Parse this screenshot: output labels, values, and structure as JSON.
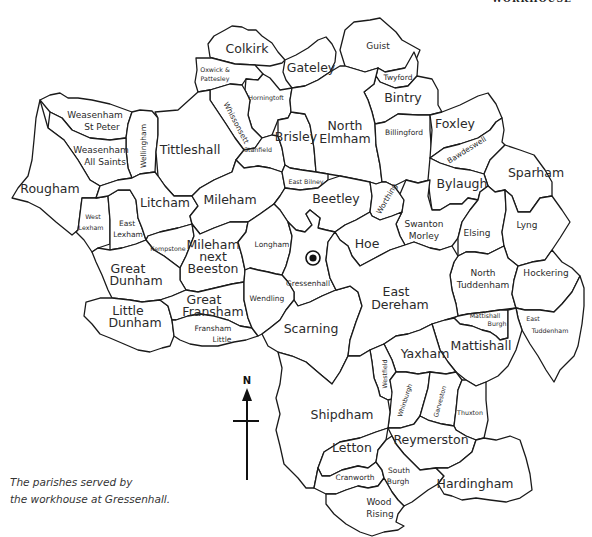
{
  "header": {
    "cropped_title_fragment": "WORKHOUSE"
  },
  "caption": {
    "line1": "The parishes served by",
    "line2": "the workhouse at Gressenhall."
  },
  "compass": {
    "label": "N"
  },
  "workhouse_marker": {
    "name": "Gressenhall workhouse",
    "icon": "target-circle-icon"
  },
  "parishes": [
    {
      "id": "colkirk",
      "label": "Colkirk"
    },
    {
      "id": "oxwick",
      "label": "Oxwick &",
      "label2": "Pattesley"
    },
    {
      "id": "gateley",
      "label": "Gateley"
    },
    {
      "id": "guist",
      "label": "Guist"
    },
    {
      "id": "twyford",
      "label": "Twyford"
    },
    {
      "id": "bintry",
      "label": "Bintry"
    },
    {
      "id": "horningtoft",
      "label": "Horningtoft"
    },
    {
      "id": "whissonsett",
      "label": "Whissonsett"
    },
    {
      "id": "weasenham-st-peter",
      "label": "Weasenham",
      "label2": "St Peter"
    },
    {
      "id": "weasenham-all-saints",
      "label": "Weasenham",
      "label2": "All Saints"
    },
    {
      "id": "wellingham",
      "label": "Wellingham"
    },
    {
      "id": "tittleshall",
      "label": "Tittleshall"
    },
    {
      "id": "stanfield",
      "label": "Stanfield"
    },
    {
      "id": "brisley",
      "label": "Brisley"
    },
    {
      "id": "north-elmham",
      "label": "North",
      "label2": "Elmham"
    },
    {
      "id": "billingford",
      "label": "Billingford"
    },
    {
      "id": "foxley",
      "label": "Foxley"
    },
    {
      "id": "bawdeswell",
      "label": "Bawdeswell"
    },
    {
      "id": "sparham",
      "label": "Sparham"
    },
    {
      "id": "bylaugh",
      "label": "Bylaugh"
    },
    {
      "id": "rougham",
      "label": "Rougham"
    },
    {
      "id": "west-lexham",
      "label": "West",
      "label2": "Lexham"
    },
    {
      "id": "east-lexham",
      "label": "East",
      "label2": "Lexham"
    },
    {
      "id": "litcham",
      "label": "Litcham"
    },
    {
      "id": "mileham",
      "label": "Mileham"
    },
    {
      "id": "east-bilney",
      "label": "East Bilney"
    },
    {
      "id": "beetley",
      "label": "Beetley"
    },
    {
      "id": "worthing",
      "label": "Worthing"
    },
    {
      "id": "swanton-morley",
      "label": "Swanton",
      "label2": "Morley"
    },
    {
      "id": "elsing",
      "label": "Elsing"
    },
    {
      "id": "lyng",
      "label": "Lyng"
    },
    {
      "id": "kempstone",
      "label": "Kempstone"
    },
    {
      "id": "mileham-next-beeston",
      "label": "Mileham",
      "label2": "next",
      "label3": "Beeston"
    },
    {
      "id": "longham",
      "label": "Longham"
    },
    {
      "id": "gressenhall",
      "label": "Gressenhall"
    },
    {
      "id": "hoe",
      "label": "Hoe"
    },
    {
      "id": "great-dunham",
      "label": "Great",
      "label2": "Dunham"
    },
    {
      "id": "north-tuddenham",
      "label": "North",
      "label2": "Tuddenham"
    },
    {
      "id": "hockering",
      "label": "Hockering"
    },
    {
      "id": "little-dunham",
      "label": "Little",
      "label2": "Dunham"
    },
    {
      "id": "great-fransham",
      "label": "Great",
      "label2": "Fransham"
    },
    {
      "id": "fransham-little",
      "label": "Fransham",
      "label2": "Little"
    },
    {
      "id": "wendling",
      "label": "Wendling"
    },
    {
      "id": "scarning",
      "label": "Scarning"
    },
    {
      "id": "east-dereham",
      "label": "East",
      "label2": "Dereham"
    },
    {
      "id": "mattishall-burgh",
      "label": "Mattishall",
      "label2": "Burgh"
    },
    {
      "id": "east-tuddenham",
      "label": "East",
      "label2": "Tuddenham"
    },
    {
      "id": "mattishall",
      "label": "Mattishall"
    },
    {
      "id": "yaxham",
      "label": "Yaxham"
    },
    {
      "id": "westfield",
      "label": "Westfield"
    },
    {
      "id": "whinburgh",
      "label": "Whinburgh"
    },
    {
      "id": "garveston",
      "label": "Garveston"
    },
    {
      "id": "thuxton",
      "label": "Thuxton"
    },
    {
      "id": "shipdham",
      "label": "Shipdham"
    },
    {
      "id": "letton",
      "label": "Letton"
    },
    {
      "id": "reymerston",
      "label": "Reymerston"
    },
    {
      "id": "cranworth",
      "label": "Cranworth"
    },
    {
      "id": "south-burgh",
      "label": "South",
      "label2": "Burgh"
    },
    {
      "id": "hardingham",
      "label": "Hardingham"
    },
    {
      "id": "wood-rising",
      "label": "Wood",
      "label2": "Rising"
    }
  ]
}
